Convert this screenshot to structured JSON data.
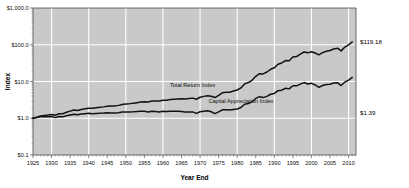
{
  "chart_data": {
    "type": "line",
    "title": "",
    "xlabel": "Year End",
    "ylabel": "Index",
    "yscale": "log",
    "ylim": [
      0.1,
      1000
    ],
    "xlim": [
      1925,
      2012
    ],
    "grid": true,
    "legend_position": "inline-annotation",
    "y_ticks": [
      "$0.1",
      "$1.0",
      "$10.0",
      "$100.0",
      "$1,000.0"
    ],
    "y_tick_values": [
      0.1,
      1,
      10,
      100,
      1000
    ],
    "x_ticks": [
      "1925",
      "1930",
      "1935",
      "1940",
      "1945",
      "1950",
      "1955",
      "1960",
      "1965",
      "1970",
      "1975",
      "1980",
      "1985",
      "1990",
      "1995",
      "2000",
      "2005",
      "2010"
    ],
    "x_tick_values": [
      1925,
      1930,
      1935,
      1940,
      1945,
      1950,
      1955,
      1960,
      1965,
      1970,
      1975,
      1980,
      1985,
      1990,
      1995,
      2000,
      2005,
      2010
    ],
    "annotations": [
      {
        "text": "Total Return Index",
        "x": 1968,
        "y": 7.0
      },
      {
        "text": "Capital Appreciation Index",
        "x": 1981,
        "y": 2.6
      }
    ],
    "end_labels": [
      {
        "text": "$119.18",
        "series": "Total Return Index",
        "value": 119.18,
        "year": 2011
      },
      {
        "text": "$1.39",
        "series": "Capital Appreciation Index",
        "value": 1.39,
        "year": 2011
      }
    ],
    "series": [
      {
        "name": "Total Return Index",
        "color": "#111111",
        "x": [
          1925,
          1926,
          1927,
          1928,
          1929,
          1930,
          1931,
          1932,
          1933,
          1934,
          1935,
          1936,
          1937,
          1938,
          1939,
          1940,
          1941,
          1942,
          1943,
          1944,
          1945,
          1946,
          1947,
          1948,
          1949,
          1950,
          1951,
          1952,
          1953,
          1954,
          1955,
          1956,
          1957,
          1958,
          1959,
          1960,
          1961,
          1962,
          1963,
          1964,
          1965,
          1966,
          1967,
          1968,
          1969,
          1970,
          1971,
          1972,
          1973,
          1974,
          1975,
          1976,
          1977,
          1978,
          1979,
          1980,
          1981,
          1982,
          1983,
          1984,
          1985,
          1986,
          1987,
          1988,
          1989,
          1990,
          1991,
          1992,
          1993,
          1994,
          1995,
          1996,
          1997,
          1998,
          1999,
          2000,
          2001,
          2002,
          2003,
          2004,
          2005,
          2006,
          2007,
          2008,
          2009,
          2010,
          2011
        ],
        "y": [
          1.0,
          1.07,
          1.15,
          1.19,
          1.22,
          1.27,
          1.21,
          1.33,
          1.33,
          1.46,
          1.56,
          1.67,
          1.63,
          1.74,
          1.81,
          1.88,
          1.86,
          1.92,
          1.98,
          2.04,
          2.12,
          2.14,
          2.17,
          2.24,
          2.38,
          2.45,
          2.5,
          2.57,
          2.66,
          2.76,
          2.79,
          2.76,
          2.96,
          2.95,
          2.93,
          3.09,
          3.1,
          3.23,
          3.3,
          3.36,
          3.39,
          3.33,
          3.43,
          3.53,
          3.29,
          3.72,
          3.94,
          4.1,
          3.98,
          3.66,
          4.22,
          4.94,
          5.1,
          5.12,
          5.49,
          5.88,
          6.7,
          8.61,
          9.36,
          10.78,
          13.88,
          16.28,
          16.1,
          18.12,
          21.5,
          23.7,
          29.5,
          31.9,
          37.1,
          36.9,
          46.5,
          47.8,
          55.2,
          63.5,
          60.2,
          64.5,
          59.8,
          53.2,
          61.2,
          66.5,
          69.8,
          76.4,
          80.5,
          68.2,
          86.5,
          99.5,
          119.18
        ]
      },
      {
        "name": "Capital Appreciation Index",
        "color": "#111111",
        "x": [
          1925,
          1926,
          1927,
          1928,
          1929,
          1930,
          1931,
          1932,
          1933,
          1934,
          1935,
          1936,
          1937,
          1938,
          1939,
          1940,
          1941,
          1942,
          1943,
          1944,
          1945,
          1946,
          1947,
          1948,
          1949,
          1950,
          1951,
          1952,
          1953,
          1954,
          1955,
          1956,
          1957,
          1958,
          1959,
          1960,
          1961,
          1962,
          1963,
          1964,
          1965,
          1966,
          1967,
          1968,
          1969,
          1970,
          1971,
          1972,
          1973,
          1974,
          1975,
          1976,
          1977,
          1978,
          1979,
          1980,
          1981,
          1982,
          1983,
          1984,
          1985,
          1986,
          1987,
          1988,
          1989,
          1990,
          1991,
          1992,
          1993,
          1994,
          1995,
          1996,
          1997,
          1998,
          1999,
          2000,
          2001,
          2002,
          2003,
          2004,
          2005,
          2006,
          2007,
          2008,
          2009,
          2010,
          2011
        ],
        "y": [
          1.0,
          1.04,
          1.09,
          1.1,
          1.1,
          1.12,
          1.04,
          1.12,
          1.09,
          1.17,
          1.23,
          1.29,
          1.24,
          1.3,
          1.33,
          1.36,
          1.32,
          1.34,
          1.36,
          1.38,
          1.41,
          1.4,
          1.39,
          1.41,
          1.47,
          1.49,
          1.49,
          1.5,
          1.52,
          1.55,
          1.54,
          1.49,
          1.56,
          1.53,
          1.49,
          1.54,
          1.52,
          1.56,
          1.56,
          1.55,
          1.53,
          1.47,
          1.48,
          1.49,
          1.36,
          1.5,
          1.56,
          1.59,
          1.5,
          1.34,
          1.49,
          1.7,
          1.71,
          1.67,
          1.73,
          1.79,
          1.96,
          2.41,
          2.52,
          2.8,
          3.46,
          3.86,
          3.65,
          3.94,
          4.5,
          4.74,
          5.64,
          5.82,
          6.55,
          6.3,
          7.65,
          7.62,
          8.46,
          9.35,
          8.55,
          8.9,
          8.05,
          6.95,
          7.8,
          8.25,
          8.45,
          9.05,
          9.3,
          7.75,
          9.65,
          10.9,
          12.9
        ]
      }
    ]
  },
  "plot": {
    "left": 33,
    "top": 8,
    "right": 356,
    "bottom": 155
  }
}
